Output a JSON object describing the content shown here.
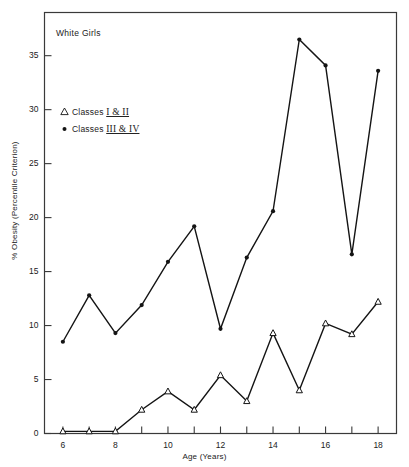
{
  "chart_data": {
    "type": "line",
    "title": "White Girls",
    "xlabel": "Age (Years)",
    "ylabel": "% Obesity (Percentile Criterion)",
    "x": [
      6,
      7,
      8,
      9,
      10,
      11,
      12,
      13,
      14,
      15,
      16,
      17,
      18
    ],
    "xlim": [
      5.3,
      18.7
    ],
    "ylim": [
      0,
      39
    ],
    "xticks_major": [
      6,
      8,
      10,
      12,
      14,
      16,
      18
    ],
    "xticks_minor": [
      7,
      9,
      11,
      13,
      15,
      17
    ],
    "xtick_labels": [
      "6",
      "8",
      "10",
      "12",
      "14",
      "16",
      "18"
    ],
    "yticks": [
      0,
      5,
      10,
      15,
      20,
      25,
      30,
      35
    ],
    "ytick_labels": [
      "0",
      "5",
      "10",
      "15",
      "20",
      "25",
      "30",
      "35"
    ],
    "grid": false,
    "legend_position": "upper-left-inside",
    "series": [
      {
        "name": "Classes I & II",
        "marker": "open-triangle",
        "values": [
          0.2,
          0.2,
          0.2,
          2.2,
          3.9,
          2.2,
          5.4,
          3.0,
          9.3,
          4.0,
          10.2,
          9.2,
          12.2
        ]
      },
      {
        "name": "Classes III & IV",
        "marker": "filled-circle",
        "values": [
          8.5,
          12.8,
          9.3,
          11.9,
          15.9,
          19.2,
          9.7,
          16.3,
          20.6,
          36.5,
          34.1,
          16.6,
          33.6
        ]
      }
    ]
  },
  "legend": {
    "items": [
      {
        "marker": "triangle-marker-icon",
        "prefix": "Classes ",
        "numerals": "I & II"
      },
      {
        "marker": "circle-marker-icon",
        "prefix": "Classes ",
        "numerals": "III & IV"
      }
    ]
  },
  "colors": {
    "line": "#141414",
    "frame": "#3a3a3a",
    "text": "#222222",
    "background": "#ffffff"
  }
}
